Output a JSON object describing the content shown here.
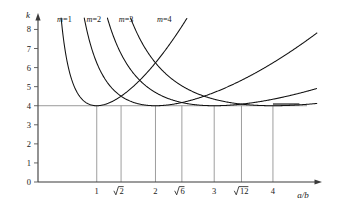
{
  "figure": {
    "name": "plate-buckling-coefficient-chart",
    "background_color": "#ffffff",
    "curve_color": "#111111",
    "grid_color": "#8d8d8d",
    "axis_color": "#3a3a3a"
  },
  "axes": {
    "x": {
      "label": "a/b",
      "min": 0,
      "max": 4.75,
      "tick_values": [
        1,
        1.41421356,
        2,
        2.44948975,
        3,
        3.46410162,
        4
      ],
      "tick_labels": [
        "1",
        "√2",
        "2",
        "√6",
        "3",
        "√12",
        "4"
      ],
      "radical_ticks": [
        {
          "value": 1.41421356,
          "radicand": "2"
        },
        {
          "value": 2.44948975,
          "radicand": "6"
        },
        {
          "value": 3.46410162,
          "radicand": "12"
        }
      ],
      "plain_ticks": [
        {
          "value": 1,
          "label": "1"
        },
        {
          "value": 2,
          "label": "2"
        },
        {
          "value": 3,
          "label": "3"
        },
        {
          "value": 4,
          "label": "4"
        }
      ]
    },
    "y": {
      "label": "k",
      "min": 0,
      "max": 8.6,
      "tick_values": [
        0,
        1,
        2,
        3,
        4,
        5,
        6,
        7,
        8
      ],
      "tick_labels": [
        "0",
        "1",
        "2",
        "3",
        "4",
        "5",
        "6",
        "7",
        "8"
      ]
    }
  },
  "annotations": {
    "asymptote_value": 4,
    "asymptote_note": "k = 4 minimum envelope"
  },
  "chart_data": {
    "type": "line",
    "title": "",
    "subtitle": "",
    "xlabel": "a/b",
    "ylabel": "k",
    "xlim": [
      0,
      4.75
    ],
    "ylim": [
      0,
      8.6
    ],
    "grid": "vertical gridlines at labeled x ticks, dropped from k=4 to axis",
    "legend": "inline labels above each curve",
    "formula": "k = (m*b/a + a/(m*b))^2",
    "categories": [],
    "series": [
      {
        "name": "m=1",
        "label": "m=1",
        "m": 1,
        "minimum_at_x": 1,
        "minimum_k": 4,
        "x": [
          0.36,
          0.4,
          0.45,
          0.5,
          0.55,
          0.6,
          0.65,
          0.7,
          0.75,
          0.8,
          0.85,
          0.9,
          0.95,
          1.0,
          1.1,
          1.2,
          1.3,
          1.41,
          1.6,
          1.8,
          2.0,
          2.2,
          2.45,
          2.6,
          2.8,
          3.0,
          3.2,
          3.46,
          3.7,
          4.0,
          4.3,
          4.55
        ],
        "y": [
          8.58,
          7.67,
          6.67,
          5.93,
          5.37,
          4.94,
          4.61,
          4.36,
          4.17,
          4.03,
          3.94,
          3.9,
          3.9,
          4.0,
          4.11,
          4.28,
          4.49,
          4.86,
          5.41,
          6.0,
          6.25,
          6.91,
          7.93,
          8.42,
          9.33,
          10.11,
          10.97,
          12.18,
          13.34,
          14.8,
          16.33,
          17.7
        ]
      },
      {
        "name": "m=2",
        "label": "m=2",
        "m": 2,
        "minimum_at_x": 2,
        "minimum_k": 4,
        "x": [
          0.72,
          0.8,
          0.9,
          1.0,
          1.1,
          1.2,
          1.3,
          1.41,
          1.5,
          1.6,
          1.7,
          1.8,
          1.9,
          2.0,
          2.2,
          2.45,
          2.6,
          2.8,
          3.0,
          3.2,
          3.46,
          3.7,
          4.0,
          4.3,
          4.55
        ],
        "y": [
          8.58,
          7.67,
          6.67,
          5.93,
          5.37,
          4.94,
          4.61,
          4.34,
          4.2,
          4.07,
          3.99,
          3.94,
          3.91,
          4.0,
          4.11,
          4.34,
          4.49,
          4.73,
          5.01,
          5.32,
          5.76,
          6.21,
          6.81,
          7.48,
          8.06
        ]
      },
      {
        "name": "m=3",
        "label": "m=3",
        "m": 3,
        "minimum_at_x": 3,
        "minimum_k": 4,
        "x": [
          1.08,
          1.2,
          1.35,
          1.5,
          1.65,
          1.8,
          1.95,
          2.1,
          2.25,
          2.45,
          2.6,
          2.75,
          2.9,
          3.0,
          3.2,
          3.46,
          3.7,
          4.0,
          4.3,
          4.55
        ],
        "y": [
          8.58,
          7.67,
          6.67,
          5.93,
          5.37,
          4.94,
          4.61,
          4.36,
          4.17,
          4.01,
          3.94,
          3.9,
          3.9,
          4.0,
          4.08,
          4.22,
          4.39,
          4.64,
          4.94,
          5.21
        ]
      },
      {
        "name": "m=4",
        "label": "m=4",
        "m": 4,
        "minimum_at_x": 4,
        "minimum_k": 4,
        "x": [
          1.44,
          1.6,
          1.8,
          2.0,
          2.2,
          2.4,
          2.45,
          2.6,
          2.8,
          3.0,
          3.2,
          3.46,
          3.6,
          3.8,
          4.0,
          4.2,
          4.4,
          4.58
        ],
        "y": [
          8.58,
          7.67,
          6.67,
          5.93,
          5.37,
          4.94,
          4.88,
          4.61,
          4.36,
          4.17,
          4.03,
          3.92,
          3.9,
          3.9,
          4.0,
          4.05,
          4.12,
          4.2
        ]
      }
    ],
    "annotations": [
      {
        "text": "m=1",
        "x": 0.45,
        "y": 8.4
      },
      {
        "text": "m=2",
        "x": 0.95,
        "y": 8.4
      },
      {
        "text": "m=3",
        "x": 1.5,
        "y": 8.4
      },
      {
        "text": "m=4",
        "x": 2.15,
        "y": 8.4
      }
    ]
  }
}
